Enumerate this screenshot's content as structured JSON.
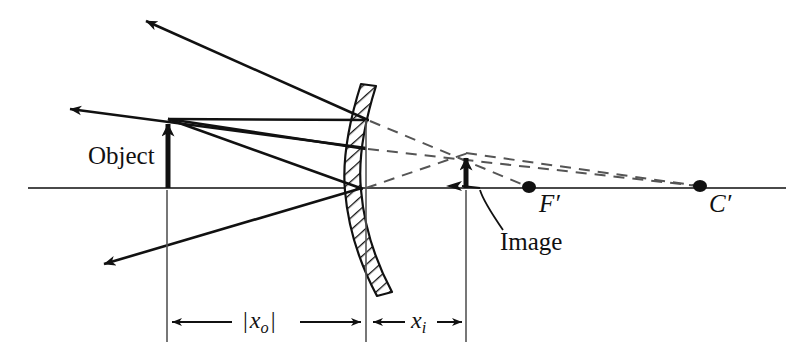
{
  "figure": {
    "type": "optics-ray-diagram",
    "background_color": "#ffffff",
    "ink_color": "#111111",
    "axis_color": "#4a4a4a",
    "dashed_color": "#555555"
  },
  "labels": {
    "object": "Object",
    "image": "Image",
    "focal_point": "F′",
    "center_of_curvature": "C′",
    "object_distance_prefix": "|",
    "object_distance_var": "x",
    "object_distance_sub": "o",
    "object_distance_suffix": "|",
    "image_distance_var": "x",
    "image_distance_sub": "i"
  },
  "geometry": {
    "optical_axis": {
      "x1": 28,
      "y1": 188,
      "x2": 786,
      "y2": 188
    },
    "object_arrow": {
      "x": 168,
      "base_y": 188,
      "tip_y": 118,
      "height": 70
    },
    "image_arrow": {
      "x": 466,
      "base_y": 188,
      "tip_y": 152,
      "height": 36
    },
    "mirror": {
      "top": {
        "x": 376,
        "y": 86
      },
      "bulge": {
        "x": 361,
        "y": 190
      },
      "bottom": {
        "x": 392,
        "y": 292
      },
      "thickness": 15,
      "hatched": true
    },
    "focal_point_dot": {
      "x": 529,
      "y": 187,
      "r": 6
    },
    "center_dot": {
      "x": 700,
      "y": 186,
      "r": 6
    },
    "rays": [
      {
        "name": "parallel-incident",
        "from": [
          168,
          118
        ],
        "to": [
          368,
          120
        ]
      },
      {
        "name": "parallel-reflected",
        "from": [
          368,
          120
        ],
        "to": [
          142,
          18
        ]
      },
      {
        "name": "center-incident",
        "from": [
          168,
          118
        ],
        "to": [
          365,
          148
        ]
      },
      {
        "name": "vertex-incident",
        "from": [
          168,
          118
        ],
        "to": [
          362,
          188
        ]
      },
      {
        "name": "vertex-reflected",
        "from": [
          362,
          188
        ],
        "to": [
          100,
          266
        ]
      },
      {
        "name": "upper-reflected-to-left",
        "from": [
          365,
          148
        ],
        "to": [
          66,
          108
        ]
      }
    ],
    "virtual_rays": [
      {
        "name": "parallel-virtual-extension",
        "from": [
          368,
          120
        ],
        "to": [
          529,
          187
        ]
      },
      {
        "name": "center-virtual-extension",
        "from": [
          365,
          148
        ],
        "to": [
          700,
          186
        ]
      },
      {
        "name": "vertex-virtual-extension",
        "from": [
          362,
          188
        ],
        "to": [
          700,
          186
        ]
      },
      {
        "name": "image-tip-to-c",
        "from": [
          466,
          152
        ],
        "to": [
          700,
          186
        ]
      }
    ],
    "dimension_lines": [
      {
        "name": "object-distance",
        "x1": 167,
        "x2": 366,
        "y": 322
      },
      {
        "name": "image-distance",
        "x1": 368,
        "x2": 466,
        "y": 322
      }
    ],
    "construction_lines": [
      {
        "name": "object-vertical",
        "x": 167,
        "y1": 188,
        "y2": 342
      },
      {
        "name": "mirror-vertical",
        "x": 366,
        "y1": 120,
        "y2": 342
      },
      {
        "name": "image-vertical",
        "x": 466,
        "y1": 188,
        "y2": 342
      }
    ],
    "image_leader": {
      "name": "image-callout-leader",
      "path": "M 503 232 C 490 216 481 201 478 190",
      "arrow_tip": [
        475,
        187
      ]
    }
  }
}
